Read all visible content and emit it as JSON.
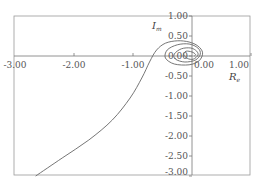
{
  "chart_data": {
    "type": "line",
    "title": "",
    "xlabel": "Re",
    "ylabel": "Im",
    "xlim": [
      -3.0,
      1.0
    ],
    "ylim": [
      -3.0,
      1.0
    ],
    "grid": false,
    "legend": null,
    "x_ticks": [
      "-3.00",
      "-2.00",
      "-1.00",
      "0.00",
      "1.00"
    ],
    "y_ticks": [
      "1.00",
      "0.50",
      "0.00",
      "-0.50",
      "-1.00",
      "-1.50",
      "-2.00",
      "-2.50",
      "-3.00"
    ],
    "x_tick_values": [
      -3,
      -2,
      -1,
      0,
      1
    ],
    "y_tick_values": [
      1,
      0.5,
      0,
      -0.5,
      -1,
      -1.5,
      -2,
      -2.5,
      -3
    ],
    "series": [
      {
        "name": "Nyquist curve",
        "color": "#666666",
        "x": [
          -2.65,
          -2.2,
          -1.75,
          -1.35,
          -1.05,
          -0.85,
          -0.72,
          -0.6,
          -0.45,
          -0.25,
          -0.05,
          0.1,
          0.18,
          0.12,
          -0.05,
          -0.3,
          -0.45,
          -0.42,
          -0.25,
          -0.05,
          0.1,
          0.14,
          0.06,
          -0.12,
          -0.28,
          -0.3,
          -0.18,
          -0.02,
          0.08,
          0.1,
          0.02,
          -0.08,
          -0.14,
          -0.1,
          0.0,
          0.06,
          0.04
        ],
        "y": [
          -3.0,
          -2.55,
          -2.1,
          -1.6,
          -1.05,
          -0.55,
          -0.15,
          0.15,
          0.32,
          0.38,
          0.35,
          0.25,
          0.08,
          -0.12,
          -0.22,
          -0.2,
          -0.05,
          0.15,
          0.28,
          0.3,
          0.2,
          0.05,
          -0.1,
          -0.15,
          -0.08,
          0.05,
          0.18,
          0.2,
          0.12,
          0.02,
          -0.08,
          -0.06,
          0.04,
          0.12,
          0.1,
          0.04,
          0.0
        ]
      }
    ]
  },
  "labels": {
    "x_axis_title": "R",
    "x_axis_sub": "e",
    "y_axis_title": "I",
    "y_axis_sub": "m"
  }
}
